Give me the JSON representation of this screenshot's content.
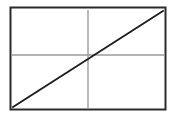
{
  "figure": {
    "title": "",
    "background_color": "#ffffff",
    "width": 179,
    "height": 119
  },
  "frame": {
    "name": "rectangular-border",
    "x": 10.5,
    "y": 7.5,
    "width": 155,
    "height": 102,
    "stroke_color": "#2b2b2b",
    "stroke_width": 2,
    "fill": "#ffffff"
  },
  "chart_data": {
    "type": "line",
    "title": "",
    "xlabel": "",
    "ylabel": "",
    "grid": false,
    "legend": null,
    "axis_lines": [
      {
        "name": "horizontal-axis-line",
        "orientation": "horizontal",
        "x1": 11,
        "y1": 55,
        "x2": 165,
        "y2": 55,
        "color": "#9a9a9a",
        "stroke_width": 1.4
      },
      {
        "name": "vertical-axis-line",
        "orientation": "vertical",
        "x1": 88,
        "y1": 10,
        "x2": 88,
        "y2": 109,
        "color": "#9a9a9a",
        "stroke_width": 1.4
      }
    ],
    "series": [
      {
        "name": "diagonal-line",
        "x": [
          13,
          163
        ],
        "y": [
          107,
          11
        ],
        "color": "#1c1c1c",
        "stroke_width": 1.8,
        "description": "straight line from lower-left to upper-right"
      }
    ],
    "intersection_point": {
      "name": "origin-crossing",
      "x": 88,
      "y": 55
    },
    "xlim": [
      11,
      165
    ],
    "ylim": [
      109,
      7
    ]
  }
}
